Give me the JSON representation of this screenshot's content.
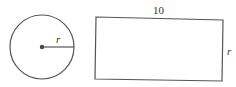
{
  "circle": {
    "cx": 42,
    "cy": 47,
    "r": 32,
    "radius_label": "r"
  },
  "rectangle": {
    "x": 95,
    "y": 18,
    "width": 128,
    "height": 62,
    "top_label": "10",
    "side_label": "r"
  },
  "colors": {
    "stroke": "#555555",
    "text": "#333333",
    "background": "#ffffff"
  }
}
